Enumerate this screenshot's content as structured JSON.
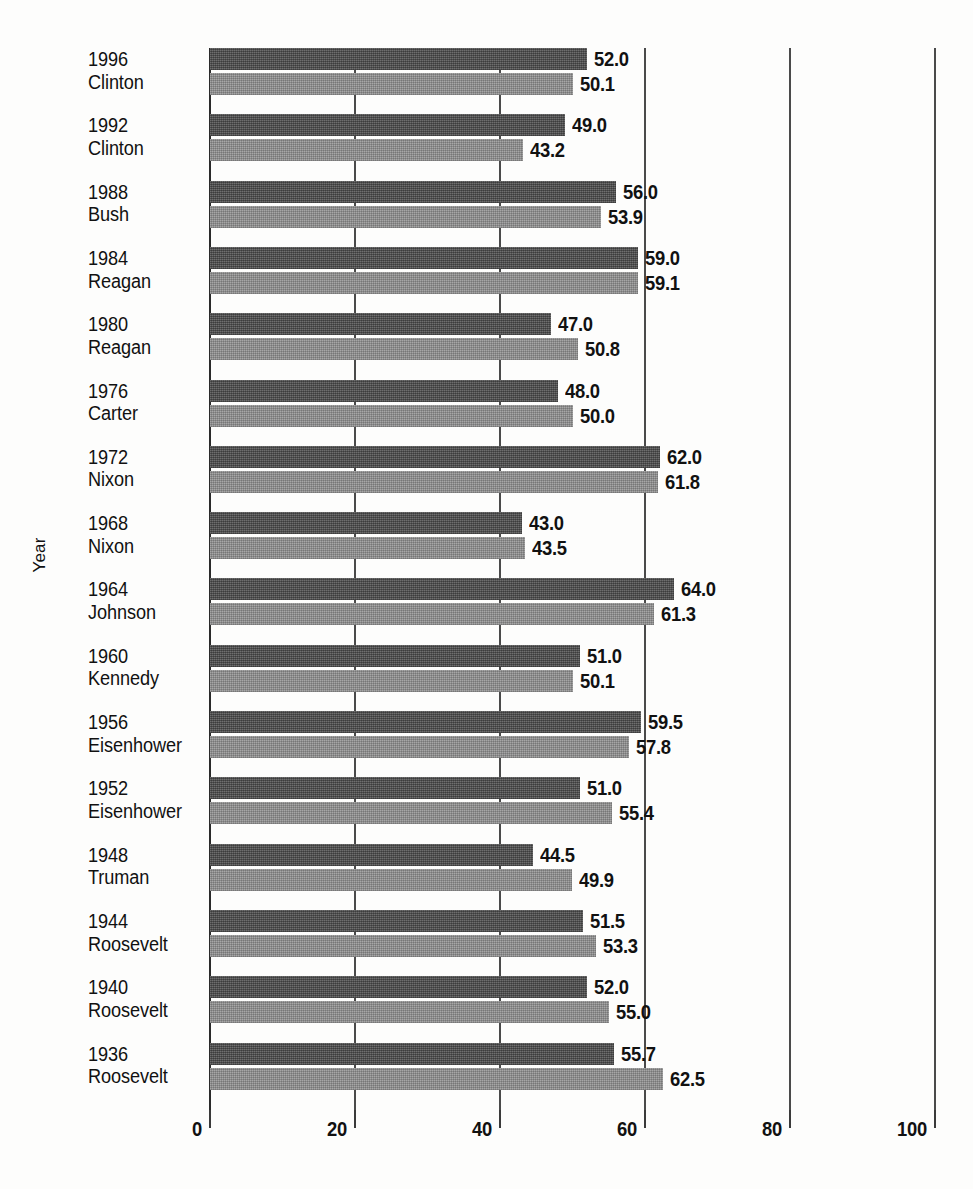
{
  "chart_data": {
    "type": "bar",
    "orientation": "horizontal",
    "title": "",
    "xlabel": "",
    "ylabel": "Year",
    "xlim": [
      0,
      100
    ],
    "xticks": [
      0,
      20,
      40,
      60,
      80,
      100
    ],
    "xtick_labels": [
      "0",
      "20",
      "40",
      "60",
      "80",
      "100"
    ],
    "grid": true,
    "grid_axis": "x",
    "legend": null,
    "categories": [
      "1996 Clinton",
      "1992 Clinton",
      "1988 Bush",
      "1984 Reagan",
      "1980 Reagan",
      "1976 Carter",
      "1972 Nixon",
      "1968 Nixon",
      "1964 Johnson",
      "1960 Kennedy",
      "1956 Eisenhower",
      "1952 Eisenhower",
      "1948 Truman",
      "1944 Roosevelt",
      "1940 Roosevelt",
      "1936 Roosevelt"
    ],
    "series": [
      {
        "name": "dark",
        "values": [
          52.0,
          49.0,
          56.0,
          59.0,
          47.0,
          48.0,
          62.0,
          43.0,
          64.0,
          51.0,
          59.5,
          51.0,
          44.5,
          51.5,
          52.0,
          55.7
        ]
      },
      {
        "name": "light",
        "values": [
          50.1,
          43.2,
          53.9,
          59.1,
          50.8,
          50.0,
          61.8,
          43.5,
          61.3,
          50.1,
          57.8,
          55.4,
          49.9,
          53.3,
          55.0,
          62.5
        ]
      }
    ]
  },
  "groups": [
    {
      "year": "1996",
      "name": "Clinton",
      "dark": "52.0",
      "light": "50.1",
      "dark_v": 52.0,
      "light_v": 50.1
    },
    {
      "year": "1992",
      "name": "Clinton",
      "dark": "49.0",
      "light": "43.2",
      "dark_v": 49.0,
      "light_v": 43.2
    },
    {
      "year": "1988",
      "name": "Bush",
      "dark": "56.0",
      "light": "53.9",
      "dark_v": 56.0,
      "light_v": 53.9
    },
    {
      "year": "1984",
      "name": "Reagan",
      "dark": "59.0",
      "light": "59.1",
      "dark_v": 59.0,
      "light_v": 59.1
    },
    {
      "year": "1980",
      "name": "Reagan",
      "dark": "47.0",
      "light": "50.8",
      "dark_v": 47.0,
      "light_v": 50.8
    },
    {
      "year": "1976",
      "name": "Carter",
      "dark": "48.0",
      "light": "50.0",
      "dark_v": 48.0,
      "light_v": 50.0
    },
    {
      "year": "1972",
      "name": "Nixon",
      "dark": "62.0",
      "light": "61.8",
      "dark_v": 62.0,
      "light_v": 61.8
    },
    {
      "year": "1968",
      "name": "Nixon",
      "dark": "43.0",
      "light": "43.5",
      "dark_v": 43.0,
      "light_v": 43.5
    },
    {
      "year": "1964",
      "name": "Johnson",
      "dark": "64.0",
      "light": "61.3",
      "dark_v": 64.0,
      "light_v": 61.3
    },
    {
      "year": "1960",
      "name": "Kennedy",
      "dark": "51.0",
      "light": "50.1",
      "dark_v": 51.0,
      "light_v": 50.1
    },
    {
      "year": "1956",
      "name": "Eisenhower",
      "dark": "59.5",
      "light": "57.8",
      "dark_v": 59.5,
      "light_v": 57.8
    },
    {
      "year": "1952",
      "name": "Eisenhower",
      "dark": "51.0",
      "light": "55.4",
      "dark_v": 51.0,
      "light_v": 55.4
    },
    {
      "year": "1948",
      "name": "Truman",
      "dark": "44.5",
      "light": "49.9",
      "dark_v": 44.5,
      "light_v": 49.9
    },
    {
      "year": "1944",
      "name": "Roosevelt",
      "dark": "51.5",
      "light": "53.3",
      "dark_v": 51.5,
      "light_v": 53.3
    },
    {
      "year": "1940",
      "name": "Roosevelt",
      "dark": "52.0",
      "light": "55.0",
      "dark_v": 52.0,
      "light_v": 55.0
    },
    {
      "year": "1936",
      "name": "Roosevelt",
      "dark": "55.7",
      "light": "62.5",
      "dark_v": 55.7,
      "light_v": 62.5
    }
  ],
  "axis": {
    "y_title": "Year",
    "x_ticks": [
      {
        "label": "0",
        "value": 0
      },
      {
        "label": "20",
        "value": 20
      },
      {
        "label": "40",
        "value": 40
      },
      {
        "label": "60",
        "value": 60
      },
      {
        "label": "80",
        "value": 80
      },
      {
        "label": "100",
        "value": 100
      }
    ]
  },
  "colors": {
    "bar_dark": "#575757",
    "bar_light": "#8e8e8e",
    "grid": "#4a4a4a",
    "axis": "#2a2a2a",
    "text": "#111111",
    "background": "#fdfdfc"
  }
}
